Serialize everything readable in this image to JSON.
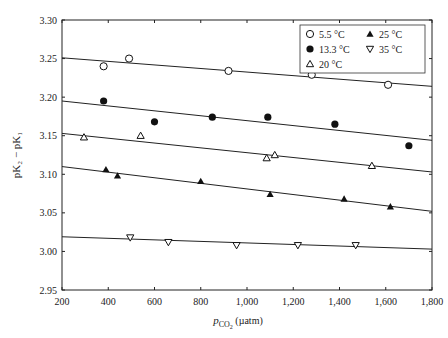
{
  "chart_data": {
    "type": "scatter",
    "title": "",
    "xlabel": "pCO2 (µatm)",
    "ylabel": "pK2 − pK1",
    "xlim": [
      200,
      1800
    ],
    "ylim": [
      2.95,
      3.3
    ],
    "x_ticks": [
      "200",
      "400",
      "600",
      "800",
      "1,000",
      "1,200",
      "1,400",
      "1,600",
      "1,800"
    ],
    "y_ticks": [
      "2.95",
      "3.00",
      "3.05",
      "3.10",
      "3.15",
      "3.20",
      "3.25",
      "3.30"
    ],
    "grid": false,
    "legend_position": "upper right",
    "series": [
      {
        "name": "5.5 °C",
        "marker": "circle-open",
        "points": [
          [
            380,
            3.24
          ],
          [
            490,
            3.25
          ],
          [
            920,
            3.234
          ],
          [
            1280,
            3.229
          ],
          [
            1610,
            3.216
          ]
        ],
        "fit": [
          [
            200,
            3.251
          ],
          [
            1800,
            3.214
          ]
        ]
      },
      {
        "name": "13.3 °C",
        "marker": "circle-filled",
        "points": [
          [
            380,
            3.195
          ],
          [
            600,
            3.168
          ],
          [
            850,
            3.174
          ],
          [
            1090,
            3.174
          ],
          [
            1380,
            3.165
          ],
          [
            1700,
            3.137
          ]
        ],
        "fit": [
          [
            200,
            3.195
          ],
          [
            1800,
            3.144
          ]
        ]
      },
      {
        "name": "20 °C",
        "marker": "triangle-up-open",
        "points": [
          [
            295,
            3.148
          ],
          [
            540,
            3.15
          ],
          [
            1085,
            3.121
          ],
          [
            1120,
            3.125
          ],
          [
            1540,
            3.111
          ]
        ],
        "fit": [
          [
            200,
            3.153
          ],
          [
            1800,
            3.103
          ]
        ]
      },
      {
        "name": "25 °C",
        "marker": "triangle-up-filled",
        "points": [
          [
            390,
            3.106
          ],
          [
            440,
            3.098
          ],
          [
            800,
            3.091
          ],
          [
            1100,
            3.074
          ],
          [
            1420,
            3.068
          ],
          [
            1620,
            3.058
          ]
        ],
        "fit": [
          [
            200,
            3.11
          ],
          [
            1800,
            3.052
          ]
        ]
      },
      {
        "name": "35 °C",
        "marker": "triangle-down-open",
        "points": [
          [
            495,
            3.018
          ],
          [
            660,
            3.012
          ],
          [
            955,
            3.008
          ],
          [
            1220,
            3.008
          ],
          [
            1470,
            3.008
          ]
        ],
        "fit": [
          [
            200,
            3.019
          ],
          [
            1800,
            3.003
          ]
        ]
      }
    ]
  },
  "legend": {
    "items": [
      "5.5 °C",
      "13.3 °C",
      "20 °C",
      "25 °C",
      "35 °C"
    ]
  },
  "axes": {
    "xlabel_main": "p",
    "xlabel_sub": "CO",
    "xlabel_subsub": "2",
    "xlabel_unit": " (µatm)",
    "ylabel": "pK₂ − pK₁"
  }
}
